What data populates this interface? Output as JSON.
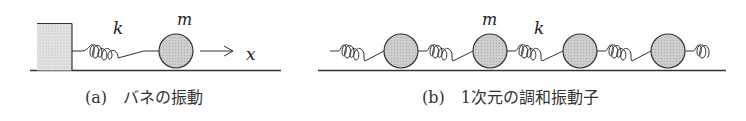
{
  "panel_a": {
    "caption": "(a)　バネの振動",
    "spring_label": "k",
    "mass_label": "m",
    "axis_label": "x"
  },
  "panel_b": {
    "caption": "(b)　1次元の調和振動子",
    "spring_label": "k",
    "mass_label": "m",
    "mass_count": 4
  },
  "colors": {
    "mass_fill": "#c8c8c8",
    "wall_fill": "#dcdcdc",
    "line": "#333333"
  }
}
